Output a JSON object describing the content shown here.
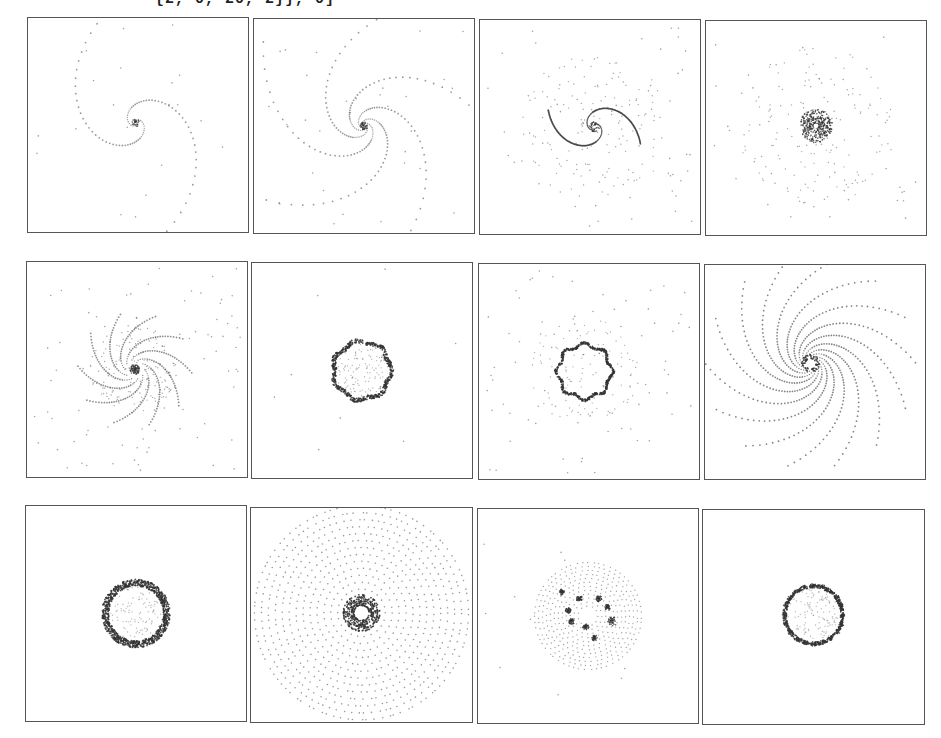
{
  "notebook": {
    "input_tail": "{2, 0, 20, 2}}, 0]"
  },
  "grid": {
    "rows": 3,
    "cols": 4,
    "panels": [
      {
        "id": 1,
        "row": 1,
        "col": 1,
        "pattern": "two-arm-spiral-sparse",
        "x": 27,
        "y": 17,
        "w": 222,
        "h": 216
      },
      {
        "id": 2,
        "row": 1,
        "col": 2,
        "pattern": "multi-arm-spiral",
        "x": 253,
        "y": 18,
        "w": 222,
        "h": 216
      },
      {
        "id": 3,
        "row": 1,
        "col": 3,
        "pattern": "two-arm-spiral-tight",
        "x": 479,
        "y": 19,
        "w": 222,
        "h": 216
      },
      {
        "id": 4,
        "row": 1,
        "col": 4,
        "pattern": "dense-core",
        "x": 705,
        "y": 20,
        "w": 222,
        "h": 216
      },
      {
        "id": 5,
        "row": 2,
        "col": 1,
        "pattern": "swirl-disk",
        "x": 26,
        "y": 261,
        "w": 222,
        "h": 217
      },
      {
        "id": 6,
        "row": 2,
        "col": 2,
        "pattern": "ring",
        "x": 251,
        "y": 262,
        "w": 222,
        "h": 217
      },
      {
        "id": 7,
        "row": 2,
        "col": 3,
        "pattern": "polygon-ring",
        "x": 478,
        "y": 263,
        "w": 222,
        "h": 217
      },
      {
        "id": 8,
        "row": 2,
        "col": 4,
        "pattern": "many-arm-spiral",
        "x": 704,
        "y": 264,
        "w": 222,
        "h": 216
      },
      {
        "id": 9,
        "row": 3,
        "col": 1,
        "pattern": "thick-ring",
        "x": 25,
        "y": 505,
        "w": 222,
        "h": 217
      },
      {
        "id": 10,
        "row": 3,
        "col": 2,
        "pattern": "concentric-core",
        "x": 250,
        "y": 507,
        "w": 223,
        "h": 216
      },
      {
        "id": 11,
        "row": 3,
        "col": 3,
        "pattern": "clumped-disk",
        "x": 477,
        "y": 508,
        "w": 222,
        "h": 216
      },
      {
        "id": 12,
        "row": 3,
        "col": 4,
        "pattern": "beaded-ring",
        "x": 702,
        "y": 509,
        "w": 223,
        "h": 216
      }
    ]
  },
  "colors": {
    "frame": "#555555",
    "dot": "#333333",
    "background": "#ffffff"
  }
}
